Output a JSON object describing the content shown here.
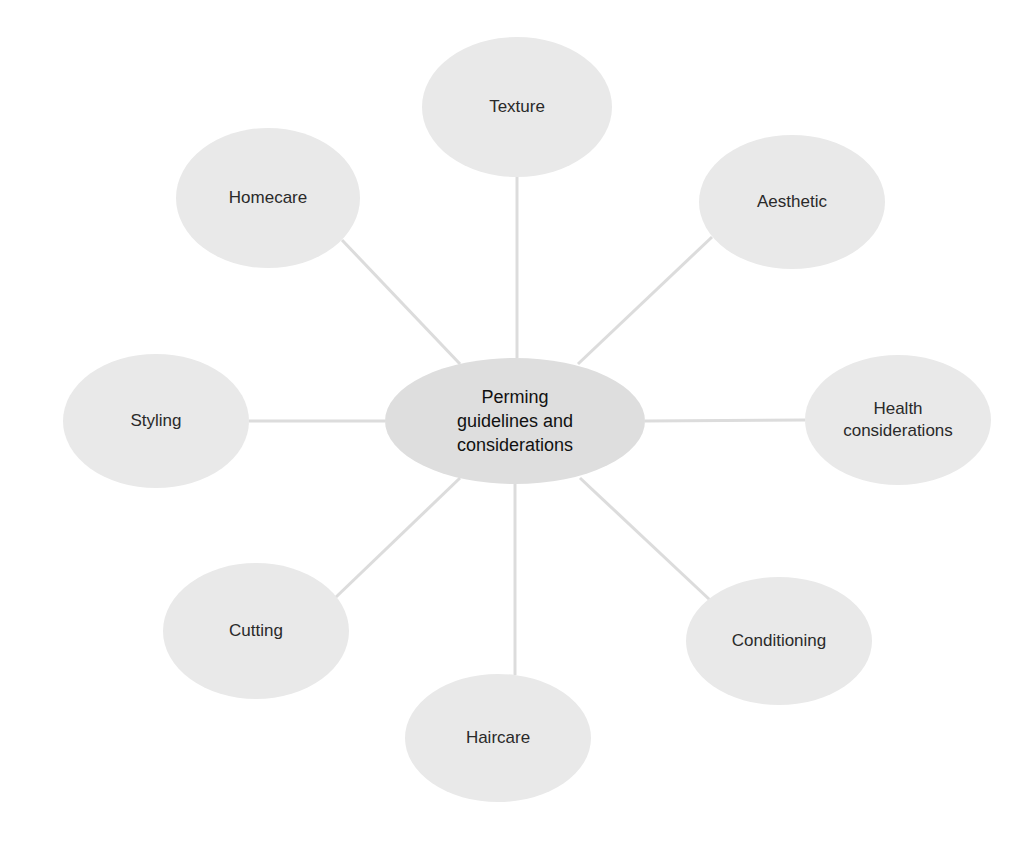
{
  "diagram": {
    "type": "mind-map",
    "colors": {
      "background": "#ffffff",
      "node_fill": "#e9e9e9",
      "center_fill": "#dedede",
      "connector": "#dcdcdc",
      "text": "#2a2a2a"
    },
    "center": {
      "label": "Perming guidelines and considerations",
      "lines": [
        "Perming",
        "guidelines and",
        "considerations"
      ],
      "cx": 515,
      "cy": 421,
      "rx": 130,
      "ry": 63
    },
    "nodes": [
      {
        "id": "texture",
        "label": "Texture",
        "lines": [
          "Texture"
        ],
        "cx": 517,
        "cy": 107,
        "rx": 95,
        "ry": 70
      },
      {
        "id": "aesthetic",
        "label": "Aesthetic",
        "lines": [
          "Aesthetic"
        ],
        "cx": 792,
        "cy": 202,
        "rx": 93,
        "ry": 67
      },
      {
        "id": "health",
        "label": "Health considerations",
        "lines": [
          "Health",
          "considerations"
        ],
        "cx": 898,
        "cy": 420,
        "rx": 93,
        "ry": 65
      },
      {
        "id": "conditioning",
        "label": "Conditioning",
        "lines": [
          "Conditioning"
        ],
        "cx": 779,
        "cy": 641,
        "rx": 93,
        "ry": 64
      },
      {
        "id": "haircare",
        "label": "Haircare",
        "lines": [
          "Haircare"
        ],
        "cx": 498,
        "cy": 738,
        "rx": 93,
        "ry": 64
      },
      {
        "id": "cutting",
        "label": "Cutting",
        "lines": [
          "Cutting"
        ],
        "cx": 256,
        "cy": 631,
        "rx": 93,
        "ry": 68
      },
      {
        "id": "styling",
        "label": "Styling",
        "lines": [
          "Styling"
        ],
        "cx": 156,
        "cy": 421,
        "rx": 93,
        "ry": 67
      },
      {
        "id": "homecare",
        "label": "Homecare",
        "lines": [
          "Homecare"
        ],
        "cx": 268,
        "cy": 198,
        "rx": 92,
        "ry": 70
      }
    ],
    "connectors": [
      {
        "from": "center",
        "to": "texture",
        "x1": 517,
        "y1": 358,
        "x2": 517,
        "y2": 177
      },
      {
        "from": "center",
        "to": "aesthetic",
        "x1": 578,
        "y1": 364,
        "x2": 712,
        "y2": 237
      },
      {
        "from": "center",
        "to": "health",
        "x1": 645,
        "y1": 421,
        "x2": 805,
        "y2": 420
      },
      {
        "from": "center",
        "to": "conditioning",
        "x1": 580,
        "y1": 478,
        "x2": 710,
        "y2": 600
      },
      {
        "from": "center",
        "to": "haircare",
        "x1": 515,
        "y1": 484,
        "x2": 515,
        "y2": 675
      },
      {
        "from": "center",
        "to": "cutting",
        "x1": 460,
        "y1": 478,
        "x2": 335,
        "y2": 598
      },
      {
        "from": "center",
        "to": "styling",
        "x1": 385,
        "y1": 421,
        "x2": 249,
        "y2": 421
      },
      {
        "from": "center",
        "to": "homecare",
        "x1": 460,
        "y1": 364,
        "x2": 342,
        "y2": 240
      }
    ]
  }
}
